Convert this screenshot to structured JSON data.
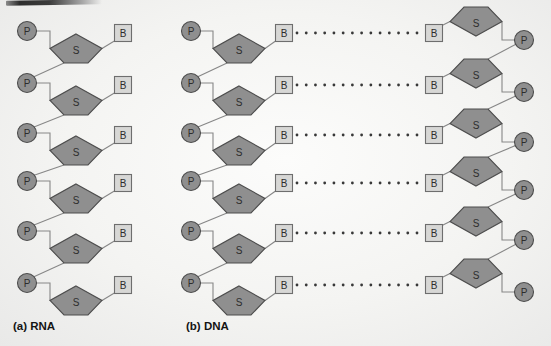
{
  "figure": {
    "caption_a": "(a) RNA",
    "caption_b": "(b) DNA"
  },
  "node_labels": {
    "phosphate": "P",
    "sugar": "S",
    "base": "B"
  },
  "colors": {
    "node_fill": "#8f8f8f",
    "node_stroke": "#4d4d4d",
    "base_fill": "#d7d7d5",
    "base_stroke": "#6e6e6e",
    "bond_line": "#878787",
    "hbond_dot": "#383838",
    "letter": "#2d2d2d"
  },
  "diagram": {
    "canvas": {
      "width": 551,
      "height": 346
    },
    "rows_y": [
      33,
      85,
      135,
      183,
      233,
      285
    ],
    "strands": [
      {
        "name": "rna-strand",
        "orientation": "up",
        "p_x": 27,
        "s_x": 76,
        "b_x": 123
      },
      {
        "name": "dna-left-strand",
        "orientation": "up",
        "p_x": 191,
        "s_x": 239,
        "b_x": 284
      },
      {
        "name": "dna-right-strand",
        "orientation": "down",
        "p_x": 524,
        "s_x": 476,
        "b_x": 434
      }
    ],
    "hydrogen_bonds": {
      "x_start": 297,
      "x_end": 417,
      "dot_count": 14
    }
  }
}
